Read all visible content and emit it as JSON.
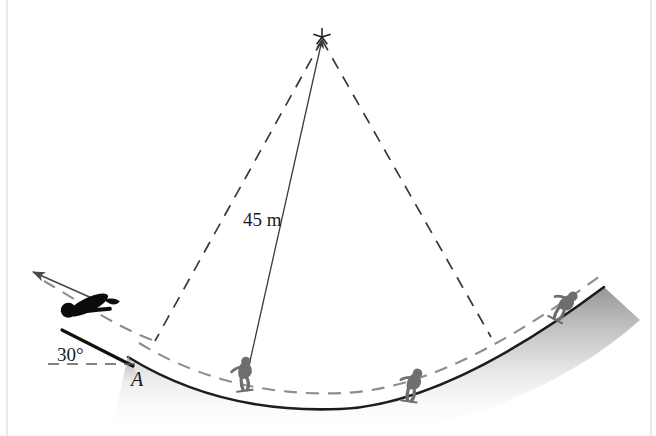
{
  "figure": {
    "background_color": "#ffffff",
    "border_color": "#e2e2e2"
  },
  "labels": {
    "radius": "45 m",
    "angle": "30°",
    "point_a": "A"
  },
  "colors": {
    "slope_line": "#1d1d1d",
    "trajectory_dash": "#8d8d8d",
    "radius_dash": "#3a3a3a",
    "radius_arrow": "#3a3a3a",
    "jumper_silhouette": "#0b0b0b",
    "skier_silhouette": "#6e6e6e",
    "ramp_line": "#111111",
    "velocity_arrow": "#4a4a4a",
    "ground_shade_top": "#8f8f8f",
    "ground_shade_bottom": "#ffffff",
    "center_mark": "#1a1a1a",
    "horizontal_ref": "#5a5a5a"
  },
  "geometry": {
    "center_mark": {
      "x": 322,
      "y": 37,
      "size": 9
    },
    "radius_line_left": {
      "x1": 322,
      "y1": 40,
      "x2": 155,
      "y2": 341
    },
    "radius_line_right": {
      "x1": 322,
      "y1": 40,
      "x2": 491,
      "y2": 337
    },
    "radius_arrow": {
      "x1": 322,
      "y1": 40,
      "x2": 246,
      "y2": 379
    },
    "valley_solid": "M 128 357 C 196 399, 268 412, 340 409 C 430 405, 528 344, 604 287",
    "valley_dashed": "M 139 343 C 205 383, 276 396, 344 393 C 432 389, 524 331, 600 276",
    "trajectory_dashed": "M 44 281 C 80 302, 118 328, 155 341",
    "ramp_line": {
      "x1": 62,
      "y1": 330,
      "x2": 133,
      "y2": 366
    },
    "ramp_wedge": "M 128 355 L 145 392 L 120 392 Z",
    "velocity_arrow": {
      "x1": 103,
      "y1": 303,
      "x2": 33,
      "y2": 272
    },
    "horizontal_ref": {
      "x1": 48,
      "y1": 364,
      "x2": 136,
      "y2": 364
    }
  },
  "figures": [
    {
      "name": "jumper-airborne",
      "pose": "flight",
      "x": 88,
      "y": 305,
      "rotation": -26,
      "scale": 1.0,
      "color_key": "jumper_silhouette"
    },
    {
      "name": "skier-first",
      "pose": "crouch",
      "x": 245,
      "y": 379,
      "rotation": -7,
      "scale": 0.78,
      "color_key": "skier_silhouette"
    },
    {
      "name": "skier-second",
      "pose": "crouch",
      "x": 412,
      "y": 390,
      "rotation": 8,
      "scale": 0.78,
      "color_key": "skier_silhouette"
    },
    {
      "name": "skier-third",
      "pose": "crouch",
      "x": 562,
      "y": 310,
      "rotation": 28,
      "scale": 0.78,
      "color_key": "skier_silhouette"
    }
  ],
  "label_positions": {
    "radius": {
      "x": 243,
      "y": 226
    },
    "angle": {
      "x": 57,
      "y": 361
    },
    "point_a": {
      "x": 131,
      "y": 386
    }
  }
}
